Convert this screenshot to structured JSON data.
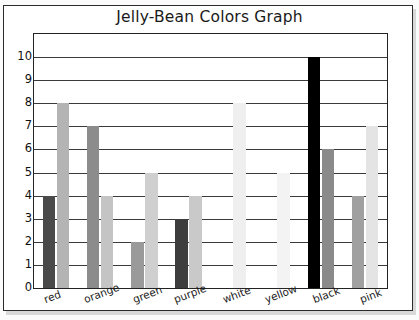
{
  "chart_data": {
    "type": "bar",
    "title": "Jelly-Bean Colors Graph",
    "xlabel": "",
    "ylabel": "",
    "ylim": [
      0,
      10
    ],
    "ytick_labels": [
      "10",
      "9",
      "8",
      "7",
      "6",
      "5",
      "4",
      "3",
      "2",
      "1",
      "0"
    ],
    "grid": true,
    "legend": "none",
    "categories": [
      "red",
      "orange",
      "green",
      "purple",
      "white",
      "yellow",
      "black",
      "pink"
    ],
    "series": [
      {
        "name": "dark",
        "values": [
          4,
          7,
          2,
          3,
          0,
          0,
          10,
          4
        ],
        "colors": [
          "#4a4a4a",
          "#8c8c8c",
          "#9a9a9a",
          "#3d3d3d",
          "#f2f2f2",
          "#f4f4f4",
          "#000000",
          "#a0a0a0"
        ]
      },
      {
        "name": "light",
        "values": [
          8,
          4,
          5,
          4,
          8,
          5,
          6,
          7
        ],
        "colors": [
          "#b4b4b4",
          "#c4c4c4",
          "#cfcfcf",
          "#c9c9c9",
          "#efefef",
          "#f3f3f3",
          "#8a8a8a",
          "#e4e4e4"
        ]
      }
    ]
  },
  "colors": {
    "frame": "#232323",
    "gridline": "#3a3a3a",
    "text": "#1a1a1a",
    "background": "#ffffff",
    "page_background": "#fbfbfb",
    "shadow": "#d8d8d8"
  }
}
